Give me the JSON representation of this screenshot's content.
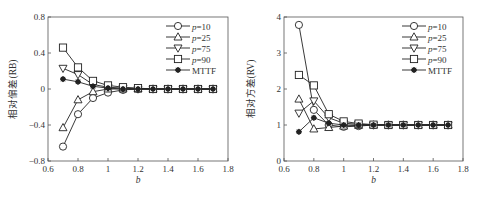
{
  "chart_data": [
    {
      "type": "line",
      "title": "",
      "xlabel": "b",
      "ylabel": "相对偏差(RB)",
      "xlim": [
        0.6,
        1.8
      ],
      "ylim": [
        -0.8,
        0.8
      ],
      "xticks": [
        0.6,
        0.8,
        1,
        1.2,
        1.4,
        1.6,
        1.8
      ],
      "xtick_labels": [
        "0.6",
        "0.8",
        "1",
        "1.2",
        "1.4",
        "1.6",
        "1.8"
      ],
      "yticks": [
        -0.8,
        -0.4,
        0,
        0.4,
        0.8
      ],
      "ytick_labels": [
        "−0.8",
        "−0.4",
        "0",
        "0.4",
        "0.8"
      ],
      "grid": false,
      "legend_position": "top-right",
      "x": [
        0.7,
        0.8,
        0.9,
        1.0,
        1.1,
        1.2,
        1.3,
        1.4,
        1.5,
        1.6,
        1.7
      ],
      "series": [
        {
          "name": "p=10",
          "name_italic": "p",
          "name_rest": "=10",
          "marker": "circle",
          "values": [
            -0.64,
            -0.28,
            -0.1,
            -0.04,
            -0.01,
            0,
            0,
            0,
            0,
            0,
            0
          ]
        },
        {
          "name": "p=25",
          "name_italic": "p",
          "name_rest": "=25",
          "marker": "triangle-up",
          "values": [
            -0.43,
            -0.12,
            -0.03,
            0,
            0,
            0,
            0,
            0,
            0,
            0,
            0
          ]
        },
        {
          "name": "p=75",
          "name_italic": "p",
          "name_rest": "=75",
          "marker": "triangle-down",
          "values": [
            0.23,
            0.16,
            0.05,
            0.02,
            0.01,
            0,
            0,
            0,
            0,
            0,
            0
          ]
        },
        {
          "name": "p=90",
          "name_italic": "p",
          "name_rest": "=90",
          "marker": "square",
          "values": [
            0.46,
            0.24,
            0.09,
            0.04,
            0.02,
            0.01,
            0,
            0,
            0,
            0,
            0
          ]
        },
        {
          "name": "MTTF",
          "name_italic": "",
          "name_rest": "MTTF",
          "marker": "star",
          "values": [
            0.11,
            0.08,
            0.03,
            0.01,
            0,
            0,
            0,
            0,
            0,
            0,
            0
          ]
        }
      ]
    },
    {
      "type": "line",
      "title": "",
      "xlabel": "b",
      "ylabel": "相对方差(RV)",
      "xlim": [
        0.6,
        1.8
      ],
      "ylim": [
        0,
        4
      ],
      "xticks": [
        0.6,
        0.8,
        1,
        1.2,
        1.4,
        1.6,
        1.8
      ],
      "xtick_labels": [
        "0.6",
        "0.8",
        "1",
        "1.2",
        "1.4",
        "1.6",
        "1.8"
      ],
      "yticks": [
        0,
        1,
        2,
        3,
        4
      ],
      "ytick_labels": [
        "0",
        "1",
        "2",
        "3",
        "4"
      ],
      "grid": false,
      "legend_position": "top-right",
      "x": [
        0.7,
        0.8,
        0.9,
        1.0,
        1.1,
        1.2,
        1.3,
        1.4,
        1.5,
        1.6,
        1.7
      ],
      "series": [
        {
          "name": "p=10",
          "name_italic": "p",
          "name_rest": "=10",
          "marker": "circle",
          "values": [
            3.78,
            1.42,
            1.0,
            0.95,
            0.97,
            1.0,
            1.0,
            1.0,
            1.0,
            1.0,
            1.0
          ]
        },
        {
          "name": "p=25",
          "name_italic": "p",
          "name_rest": "=25",
          "marker": "triangle-up",
          "values": [
            1.72,
            0.89,
            0.93,
            0.97,
            0.99,
            1.0,
            1.0,
            1.0,
            1.0,
            1.0,
            1.0
          ]
        },
        {
          "name": "p=75",
          "name_italic": "p",
          "name_rest": "=75",
          "marker": "triangle-down",
          "values": [
            1.33,
            1.67,
            1.2,
            1.05,
            1.02,
            1.0,
            1.0,
            1.0,
            1.0,
            1.0,
            1.0
          ]
        },
        {
          "name": "p=90",
          "name_italic": "p",
          "name_rest": "=90",
          "marker": "square",
          "values": [
            2.39,
            2.1,
            1.3,
            1.1,
            1.04,
            1.01,
            1.0,
            1.0,
            1.0,
            1.0,
            1.0
          ]
        },
        {
          "name": "MTTF",
          "name_italic": "",
          "name_rest": "MTTF",
          "marker": "star",
          "values": [
            0.81,
            1.2,
            1.05,
            1.0,
            1.0,
            1.0,
            1.0,
            1.0,
            1.0,
            1.0,
            1.0
          ]
        }
      ]
    }
  ]
}
